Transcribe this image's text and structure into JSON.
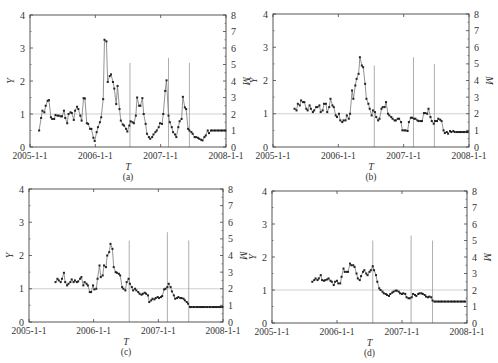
{
  "figure": {
    "panels": [
      "(a)",
      "(b)",
      "(c)",
      "(d)"
    ]
  },
  "chart_data": [
    {
      "type": "line",
      "panel_label": "(a)",
      "xlabel": "T",
      "ylabel": "Y",
      "y2label": "M",
      "x_tick_labels": [
        "2005-1-1",
        "2006-1-1",
        "2007-1-1",
        "2008-1-1"
      ],
      "ylim": [
        0,
        4
      ],
      "y_ticks": [
        0,
        1,
        2,
        3,
        4
      ],
      "y2lim": [
        0,
        8
      ],
      "y2_ticks": [
        0,
        1,
        2,
        3,
        4,
        5,
        6,
        7,
        8
      ],
      "reference_line_y": 1,
      "grid": false,
      "x_unit": "year fraction from 2005-1-1",
      "series": [
        {
          "name": "Y",
          "marker": "square",
          "x": [
            0.14,
            0.17,
            0.19,
            0.22,
            0.24,
            0.27,
            0.29,
            0.32,
            0.34,
            0.37,
            0.39,
            0.42,
            0.44,
            0.47,
            0.49,
            0.52,
            0.54,
            0.57,
            0.59,
            0.62,
            0.64,
            0.67,
            0.69,
            0.72,
            0.74,
            0.77,
            0.79,
            0.82,
            0.84,
            0.87,
            0.89,
            0.92,
            0.94,
            0.97,
            0.99,
            1.02,
            1.04,
            1.07,
            1.09,
            1.12,
            1.14,
            1.17,
            1.19,
            1.22,
            1.24,
            1.27,
            1.29,
            1.32,
            1.34,
            1.37,
            1.39,
            1.42,
            1.44,
            1.47,
            1.49,
            1.52,
            1.54,
            1.57,
            1.59,
            1.62,
            1.64,
            1.67,
            1.69,
            1.72,
            1.74,
            1.77,
            1.79,
            1.82,
            1.84,
            1.87,
            1.89,
            1.92,
            1.94,
            1.97,
            1.99,
            2.02,
            2.04,
            2.07,
            2.09,
            2.12,
            2.14,
            2.17,
            2.19,
            2.22,
            2.24,
            2.27,
            2.29,
            2.32,
            2.34,
            2.37,
            2.39,
            2.42,
            2.44,
            2.47,
            2.49,
            2.52,
            2.54,
            2.57,
            2.59,
            2.62,
            2.64,
            2.67,
            2.69,
            2.72,
            2.74,
            2.77,
            2.79,
            2.82,
            2.84,
            2.87,
            2.89,
            2.92,
            2.94,
            2.97,
            2.99
          ],
          "values": [
            0.5,
            0.88,
            1.1,
            1.05,
            1.25,
            1.4,
            1.42,
            0.9,
            0.85,
            0.85,
            0.97,
            0.95,
            0.95,
            0.93,
            0.93,
            1.1,
            0.88,
            0.72,
            1.0,
            1.05,
            1.03,
            0.82,
            1.1,
            1.22,
            1.15,
            0.95,
            0.8,
            1.48,
            1.47,
            0.72,
            0.7,
            0.55,
            0.55,
            0.28,
            0.18,
            0.45,
            0.6,
            0.75,
            0.9,
            1.45,
            3.25,
            3.2,
            1.97,
            2.15,
            2.2,
            1.97,
            1.77,
            1.3,
            1.85,
            1.15,
            0.8,
            0.68,
            0.65,
            0.55,
            0.47,
            0.65,
            0.78,
            0.75,
            0.72,
            0.95,
            1.5,
            1.25,
            1.25,
            1.48,
            1.0,
            0.7,
            0.4,
            0.3,
            0.25,
            0.3,
            0.38,
            0.45,
            0.5,
            0.6,
            0.72,
            0.7,
            1.0,
            1.7,
            2.02,
            0.95,
            0.75,
            0.6,
            0.45,
            0.38,
            0.3,
            0.6,
            0.78,
            0.85,
            1.52,
            1.2,
            1.15,
            0.55,
            0.5,
            0.45,
            0.4,
            0.3,
            0.3,
            0.28,
            0.25,
            0.22,
            0.2,
            0.3,
            0.35,
            0.5,
            0.42,
            0.5,
            0.5,
            0.5,
            0.5,
            0.5,
            0.5,
            0.5,
            0.5,
            0.5,
            0.5
          ]
        },
        {
          "name": "M (earthquake magnitude bars)",
          "type": "vlines",
          "x": [
            1.53,
            2.12,
            2.44
          ],
          "values": [
            5.1,
            5.4,
            5.1
          ]
        }
      ]
    },
    {
      "type": "line",
      "panel_label": "(b)",
      "xlabel": "T",
      "ylabel": "Y",
      "y2label": "M",
      "x_tick_labels": [
        "2005-1-1",
        "2006-1-1",
        "2007-1-1",
        "2008-1-1"
      ],
      "ylim": [
        0,
        4
      ],
      "y_ticks": [
        0,
        1,
        2,
        3,
        4
      ],
      "y2lim": [
        0,
        8
      ],
      "y2_ticks": [
        0,
        1,
        2,
        3,
        4,
        5,
        6,
        7,
        8
      ],
      "reference_line_y": 1,
      "grid": false,
      "series": [
        {
          "name": "Y",
          "marker": "square",
          "x": [
            0.33,
            0.36,
            0.38,
            0.41,
            0.43,
            0.46,
            0.48,
            0.51,
            0.53,
            0.56,
            0.58,
            0.61,
            0.63,
            0.66,
            0.68,
            0.71,
            0.73,
            0.76,
            0.78,
            0.81,
            0.83,
            0.86,
            0.88,
            0.91,
            0.93,
            0.96,
            0.98,
            1.01,
            1.03,
            1.06,
            1.08,
            1.11,
            1.13,
            1.16,
            1.18,
            1.21,
            1.23,
            1.26,
            1.28,
            1.31,
            1.33,
            1.36,
            1.38,
            1.41,
            1.43,
            1.46,
            1.48,
            1.51,
            1.53,
            1.56,
            1.58,
            1.61,
            1.63,
            1.66,
            1.68,
            1.71,
            1.73,
            1.76,
            1.78,
            1.81,
            1.83,
            1.86,
            1.88,
            1.91,
            1.93,
            1.96,
            1.98,
            2.01,
            2.03,
            2.06,
            2.08,
            2.11,
            2.13,
            2.16,
            2.18,
            2.21,
            2.23,
            2.26,
            2.28,
            2.31,
            2.33,
            2.36,
            2.38,
            2.41,
            2.43,
            2.46,
            2.48,
            2.51,
            2.53,
            2.56,
            2.58,
            2.61,
            2.63,
            2.66,
            2.68,
            2.71,
            2.73,
            2.76,
            2.78,
            2.81,
            2.83,
            2.86,
            2.88,
            2.91,
            2.93,
            2.96,
            2.98
          ],
          "values": [
            1.15,
            1.1,
            1.3,
            1.25,
            1.4,
            1.35,
            1.35,
            1.15,
            1.1,
            1.25,
            1.15,
            1.05,
            1.1,
            1.2,
            1.2,
            1.25,
            1.05,
            1.1,
            1.3,
            1.3,
            1.05,
            1.2,
            1.45,
            1.25,
            1.2,
            0.95,
            0.9,
            1.0,
            0.8,
            0.75,
            0.8,
            0.8,
            0.95,
            0.85,
            1.0,
            1.7,
            1.45,
            1.85,
            2.05,
            2.2,
            2.7,
            2.45,
            2.4,
            1.9,
            1.45,
            1.3,
            1.15,
            0.95,
            1.1,
            1.05,
            0.9,
            0.8,
            0.85,
            1.15,
            1.2,
            1.2,
            1.35,
            1.0,
            0.95,
            0.9,
            0.85,
            0.8,
            0.8,
            0.85,
            0.85,
            0.75,
            0.5,
            0.5,
            0.5,
            0.48,
            0.75,
            0.88,
            0.88,
            0.85,
            0.85,
            0.8,
            0.78,
            0.78,
            0.78,
            1.02,
            1.02,
            1.0,
            1.15,
            0.9,
            0.78,
            0.7,
            0.78,
            0.78,
            0.85,
            0.82,
            0.78,
            0.5,
            0.42,
            0.45,
            0.4,
            0.48,
            0.45,
            0.48,
            0.45,
            0.45,
            0.45,
            0.45,
            0.45,
            0.45,
            0.45,
            0.45,
            0.45
          ]
        },
        {
          "name": "M (earthquake magnitude bars)",
          "type": "vlines",
          "x": [
            1.55,
            2.15,
            2.47
          ],
          "values": [
            4.9,
            5.4,
            5.0
          ]
        }
      ]
    },
    {
      "type": "line",
      "panel_label": "(c)",
      "xlabel": "T",
      "ylabel": "Y",
      "y2label": "M",
      "x_tick_labels": [
        "2005-1-1",
        "2006-1-1",
        "2007-1-1",
        "2008-1-1"
      ],
      "ylim": [
        0,
        4
      ],
      "y_ticks": [
        0,
        1,
        2,
        3,
        4
      ],
      "y2lim": [
        0,
        8
      ],
      "y2_ticks": [
        0,
        1,
        2,
        3,
        4,
        5,
        6,
        7,
        8
      ],
      "reference_line_y": 1,
      "grid": false,
      "series": [
        {
          "name": "Y",
          "marker": "square",
          "x": [
            0.41,
            0.44,
            0.46,
            0.49,
            0.51,
            0.54,
            0.56,
            0.59,
            0.61,
            0.64,
            0.66,
            0.69,
            0.71,
            0.74,
            0.76,
            0.79,
            0.81,
            0.84,
            0.86,
            0.89,
            0.91,
            0.94,
            0.96,
            0.99,
            1.01,
            1.04,
            1.06,
            1.09,
            1.11,
            1.14,
            1.16,
            1.19,
            1.21,
            1.24,
            1.26,
            1.29,
            1.31,
            1.34,
            1.36,
            1.39,
            1.41,
            1.44,
            1.46,
            1.49,
            1.51,
            1.54,
            1.56,
            1.59,
            1.61,
            1.64,
            1.66,
            1.69,
            1.71,
            1.74,
            1.76,
            1.79,
            1.81,
            1.84,
            1.86,
            1.89,
            1.91,
            1.94,
            1.96,
            1.99,
            2.01,
            2.04,
            2.06,
            2.09,
            2.11,
            2.14,
            2.16,
            2.19,
            2.21,
            2.24,
            2.26,
            2.29,
            2.31,
            2.34,
            2.36,
            2.39,
            2.41,
            2.44,
            2.46,
            2.49,
            2.51,
            2.54,
            2.56,
            2.59,
            2.61,
            2.64,
            2.66,
            2.69,
            2.71,
            2.74,
            2.76,
            2.79,
            2.81,
            2.84,
            2.86,
            2.89,
            2.91,
            2.94,
            2.96,
            2.99
          ],
          "values": [
            1.2,
            1.3,
            1.25,
            1.2,
            1.3,
            1.48,
            1.2,
            1.1,
            1.15,
            1.2,
            1.28,
            1.2,
            1.25,
            1.2,
            1.22,
            1.3,
            1.35,
            1.1,
            1.2,
            1.15,
            1.1,
            0.9,
            0.9,
            1.1,
            0.98,
            1.0,
            1.3,
            1.7,
            1.35,
            1.4,
            1.7,
            1.65,
            2.0,
            2.1,
            2.35,
            2.2,
            1.65,
            1.5,
            1.48,
            1.45,
            1.4,
            1.05,
            1.0,
            0.95,
            1.2,
            1.3,
            1.15,
            1.05,
            0.95,
            1.0,
            0.95,
            0.9,
            0.85,
            0.82,
            0.85,
            0.88,
            0.85,
            0.8,
            0.6,
            0.65,
            0.7,
            0.68,
            0.72,
            0.75,
            0.72,
            0.75,
            0.78,
            0.98,
            1.0,
            1.05,
            1.15,
            1.05,
            0.92,
            0.8,
            0.7,
            0.72,
            0.75,
            0.72,
            0.72,
            0.7,
            0.65,
            0.6,
            0.55,
            0.45,
            0.45,
            0.45,
            0.45,
            0.45,
            0.45,
            0.45,
            0.45,
            0.45,
            0.45,
            0.45,
            0.45,
            0.45,
            0.45,
            0.45,
            0.45,
            0.45,
            0.45,
            0.45,
            0.45,
            0.45
          ]
        },
        {
          "name": "M (earthquake magnitude bars)",
          "type": "vlines",
          "x": [
            1.55,
            2.14,
            2.47
          ],
          "values": [
            4.9,
            5.4,
            4.9
          ]
        }
      ]
    },
    {
      "type": "line",
      "panel_label": "(d)",
      "xlabel": "T",
      "ylabel": "Y",
      "y2label": "M",
      "x_tick_labels": [
        "2005-1-1",
        "2006-1-1",
        "2007-1-1",
        "2008-1-1"
      ],
      "ylim": [
        0,
        4
      ],
      "y_ticks": [
        0,
        1,
        2,
        3,
        4
      ],
      "y2lim": [
        0,
        8
      ],
      "y2_ticks": [
        0,
        1,
        2,
        3,
        4,
        5,
        6,
        7,
        8
      ],
      "reference_line_y": 1,
      "grid": false,
      "series": [
        {
          "name": "Y",
          "marker": "square",
          "x": [
            0.62,
            0.65,
            0.67,
            0.7,
            0.72,
            0.75,
            0.77,
            0.8,
            0.82,
            0.85,
            0.87,
            0.9,
            0.92,
            0.95,
            0.97,
            1.0,
            1.02,
            1.05,
            1.07,
            1.1,
            1.12,
            1.15,
            1.17,
            1.2,
            1.22,
            1.25,
            1.27,
            1.3,
            1.32,
            1.35,
            1.37,
            1.4,
            1.42,
            1.45,
            1.47,
            1.5,
            1.52,
            1.55,
            1.57,
            1.6,
            1.62,
            1.65,
            1.67,
            1.7,
            1.72,
            1.75,
            1.77,
            1.8,
            1.82,
            1.85,
            1.87,
            1.9,
            1.92,
            1.95,
            1.97,
            2.0,
            2.02,
            2.05,
            2.07,
            2.1,
            2.12,
            2.15,
            2.17,
            2.2,
            2.22,
            2.25,
            2.27,
            2.3,
            2.32,
            2.35,
            2.37,
            2.4,
            2.42,
            2.45,
            2.47,
            2.5,
            2.52,
            2.55,
            2.57,
            2.6,
            2.62,
            2.65,
            2.67,
            2.7,
            2.72,
            2.75,
            2.77,
            2.8,
            2.82,
            2.85,
            2.87,
            2.9,
            2.92,
            2.95,
            2.97
          ],
          "values": [
            1.25,
            1.3,
            1.35,
            1.3,
            1.35,
            1.45,
            1.3,
            1.28,
            1.3,
            1.32,
            1.35,
            1.28,
            1.25,
            1.15,
            1.25,
            1.28,
            1.2,
            1.2,
            1.4,
            1.65,
            1.55,
            1.55,
            1.55,
            1.8,
            1.75,
            1.75,
            1.7,
            1.5,
            1.35,
            1.3,
            1.42,
            1.55,
            1.6,
            1.5,
            1.45,
            1.55,
            1.6,
            1.72,
            1.6,
            1.45,
            1.25,
            1.05,
            1.0,
            0.95,
            0.9,
            0.88,
            0.85,
            0.82,
            0.88,
            0.92,
            0.95,
            0.98,
            0.98,
            0.95,
            0.9,
            0.88,
            0.9,
            0.88,
            0.78,
            0.75,
            0.75,
            0.78,
            0.88,
            0.85,
            0.82,
            0.88,
            0.9,
            0.9,
            0.88,
            0.85,
            0.8,
            0.78,
            0.8,
            0.78,
            0.68,
            0.65,
            0.65,
            0.65,
            0.65,
            0.65,
            0.65,
            0.65,
            0.65,
            0.65,
            0.65,
            0.65,
            0.65,
            0.65,
            0.65,
            0.65,
            0.65,
            0.65,
            0.65,
            0.65,
            0.65
          ]
        },
        {
          "name": "M (earthquake magnitude bars)",
          "type": "vlines",
          "x": [
            1.55,
            2.14,
            2.47
          ],
          "values": [
            5.0,
            5.3,
            5.0
          ]
        }
      ]
    }
  ]
}
